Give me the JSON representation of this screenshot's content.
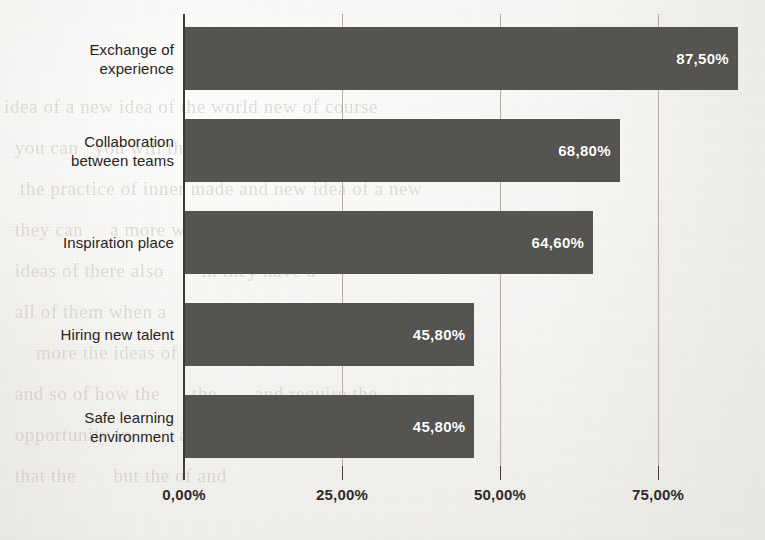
{
  "chart_data": {
    "type": "bar",
    "orientation": "horizontal",
    "title": "",
    "subtitle": "",
    "xlabel": "",
    "ylabel": "",
    "categories": [
      "Exchange of experience",
      "Collaboration between teams",
      "Inspiration place",
      "Hiring new talent",
      "Safe learning environment"
    ],
    "values": [
      87.5,
      68.8,
      64.6,
      45.8,
      45.8
    ],
    "value_labels": [
      "87,50%",
      "68,80%",
      "64,60%",
      "45,80%",
      "45,80%"
    ],
    "xlim": [
      0,
      92
    ],
    "xticks": [
      0,
      25,
      50,
      75
    ],
    "xtick_labels": [
      "0,00%",
      "25,00%",
      "50,00%",
      "75,00%"
    ],
    "grid": "vertical-only",
    "legend": "none",
    "bar_color": "#565451",
    "value_label_color": "#ffffff",
    "axis_color": "#3c3a37",
    "gridline_color": "#b2aea7",
    "background_color": "#f3f2f0"
  },
  "category_lines": [
    [
      "Exchange of",
      "experience"
    ],
    [
      "Collaboration",
      "between teams"
    ],
    [
      "Inspiration place"
    ],
    [
      "Hiring new talent"
    ],
    [
      "Safe learning",
      "environment"
    ]
  ],
  "page_backdrop": {
    "ghost_text": "idea of a new idea of the world new of course\n  you can   you will the ideas of the world\n   the practice of inner made and new idea of a new\n  they can     a more where it is and\n  ideas of there also       in they have a\n  all of them when a    idea of them and community\n      more the ideas of the new and\n  and so of how the      the       and require the\n  opportunity in         a new and\n  that the       but the of and"
  }
}
